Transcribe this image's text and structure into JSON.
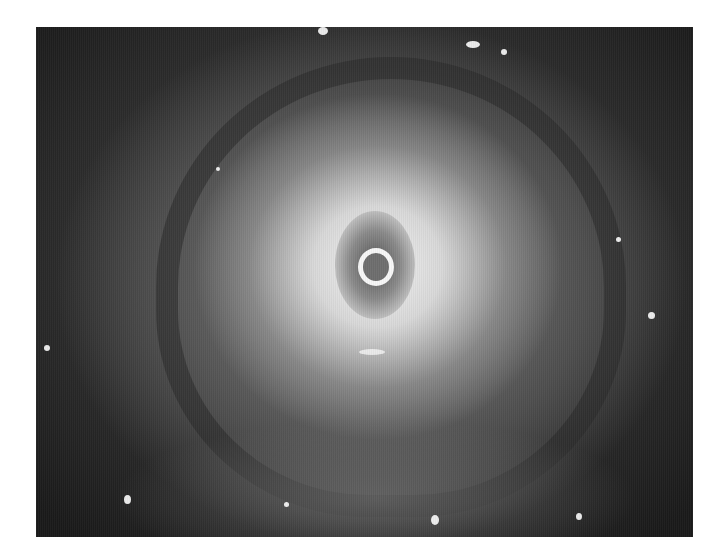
{
  "image": {
    "description": "Grayscale endoscopic view of a circular tissue lumen with a central ring-shaped opening and specular highlights",
    "palette": {
      "background": "#ffffff",
      "center": "#f2f2f2",
      "mid": "#7a7a7a",
      "edge": "#1a1a1a"
    },
    "frame": {
      "left": 36,
      "top": 27,
      "width": 657,
      "height": 510
    }
  }
}
